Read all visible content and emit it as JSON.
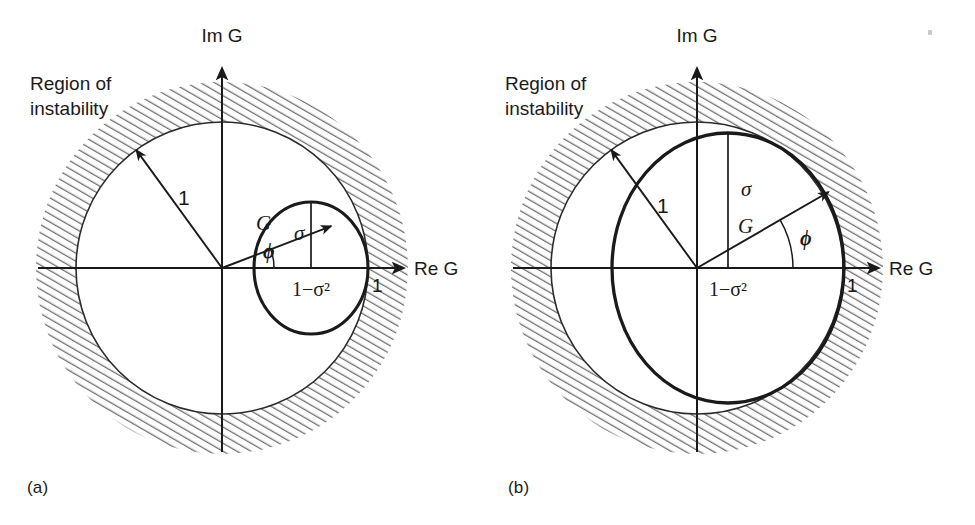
{
  "figure": {
    "type": "diagram",
    "panels": [
      {
        "id": "a",
        "caption": "(a)",
        "region_label_line1": "Region of",
        "region_label_line2": "instability",
        "axis_imag": "Im G",
        "axis_real": "Re G",
        "unit_radius_label": "1",
        "real_intercept_label": "1",
        "vector_label": "G",
        "angle_label": "ϕ",
        "sigma_label": "σ",
        "center_label": "1−σ²",
        "geometry": {
          "origin_x": 222,
          "origin_y": 268,
          "unit_radius": 146,
          "hatch_outer_radius": 186,
          "inner_circle_center_x": 311,
          "inner_circle_center_y": 268,
          "inner_radius_x": 57,
          "inner_radius_y": 66,
          "sigma_top_y": 202,
          "phi_deg": 21,
          "g_length": 117,
          "unit_arrow_deg": 126
        }
      },
      {
        "id": "b",
        "caption": "(b)",
        "region_label_line1": "Region of",
        "region_label_line2": "instability",
        "axis_imag": "Im G",
        "axis_real": "Re G",
        "unit_radius_label": "1",
        "real_intercept_label": "1",
        "vector_label": "G",
        "angle_label": "ϕ",
        "sigma_label": "σ",
        "center_label": "1−σ²",
        "geometry": {
          "origin_x": 697,
          "origin_y": 268,
          "unit_radius": 146,
          "hatch_outer_radius": 186,
          "inner_circle_center_x": 728,
          "inner_circle_center_y": 268,
          "inner_radius_x": 116,
          "inner_radius_y": 135,
          "sigma_top_y": 133,
          "phi_deg": 30,
          "g_length": 152,
          "unit_arrow_deg": 126
        }
      }
    ],
    "colors": {
      "ink": "#1a1a1a",
      "thin_stroke": "#2b2b2b",
      "hatch": "#6f6f6f",
      "background": "#ffffff"
    }
  }
}
